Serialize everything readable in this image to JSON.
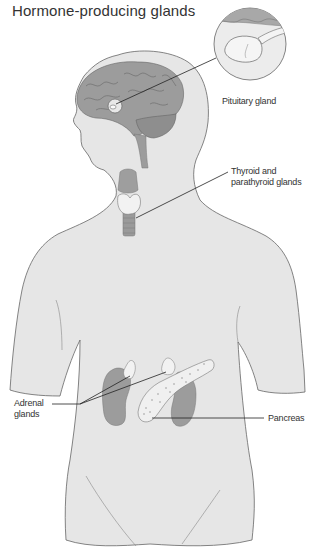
{
  "title": "Hormone-producing glands",
  "labels": {
    "pituitary": "Pituitary gland",
    "thyroid_line1": "Thyroid and",
    "thyroid_line2": "parathyroid glands",
    "adrenal_line1": "Adrenal",
    "adrenal_line2": "glands",
    "pancreas": "Pancreas"
  },
  "colors": {
    "body_fill": "#e6e6e6",
    "organ_fill": "#9c9c9c",
    "gland_fill": "#f2f2f2",
    "outline": "#555555",
    "leader_line": "#222222"
  }
}
